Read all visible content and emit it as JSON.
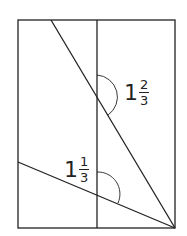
{
  "diagram": {
    "type": "geometry",
    "labels": {
      "upper_angle": {
        "whole": "1",
        "numerator": "2",
        "denominator": "3"
      },
      "lower_angle": {
        "whole": "1",
        "numerator": "1",
        "denominator": "3"
      }
    },
    "colors": {
      "stroke": "#222222",
      "background": "#ffffff"
    }
  }
}
